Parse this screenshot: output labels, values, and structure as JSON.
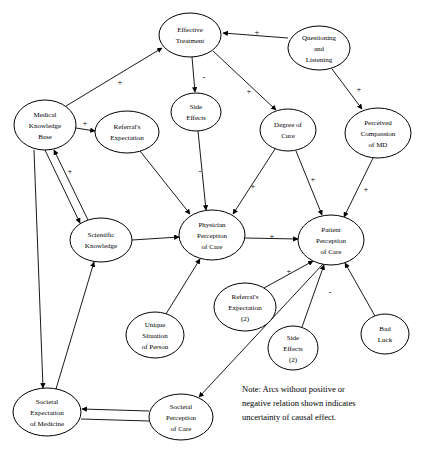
{
  "diagram": {
    "nodes": [
      {
        "id": "effective-treatment",
        "label_lines": [
          "Effective",
          "Treatment"
        ],
        "cx": 190,
        "cy": 35,
        "rx": 31,
        "ry": 22
      },
      {
        "id": "questioning-and-listening",
        "label_lines": [
          "Questioning",
          "and",
          "Listening"
        ],
        "cx": 319,
        "cy": 48,
        "rx": 31,
        "ry": 22
      },
      {
        "id": "medical-knowledge-base",
        "label_lines": [
          "Medical",
          "Knowledge",
          "Base"
        ],
        "cx": 45,
        "cy": 125,
        "rx": 31,
        "ry": 25
      },
      {
        "id": "side-effects",
        "label_lines": [
          "Side",
          "Effects"
        ],
        "cx": 196,
        "cy": 112,
        "rx": 25,
        "ry": 19
      },
      {
        "id": "degree-of-cure",
        "label_lines": [
          "Degree of",
          "Cure"
        ],
        "cx": 288,
        "cy": 130,
        "rx": 28,
        "ry": 21
      },
      {
        "id": "perceived-compassion-of-md",
        "label_lines": [
          "Perceived",
          "Compassion",
          "of MD"
        ],
        "cx": 378,
        "cy": 133,
        "rx": 33,
        "ry": 25
      },
      {
        "id": "referrals-expectation",
        "label_lines": [
          "Referral's",
          "Expectation"
        ],
        "cx": 127,
        "cy": 132,
        "rx": 32,
        "ry": 21
      },
      {
        "id": "scientific-knowledge",
        "label_lines": [
          "Scientific",
          "Knowledge"
        ],
        "cx": 101,
        "cy": 240,
        "rx": 31,
        "ry": 22
      },
      {
        "id": "physician-perception-of-care",
        "label_lines": [
          "Physician",
          "Perception",
          "of Care"
        ],
        "cx": 212,
        "cy": 235,
        "rx": 33,
        "ry": 25
      },
      {
        "id": "patient-perception-of-care",
        "label_lines": [
          "Patient",
          "Perception",
          "of Care"
        ],
        "cx": 331,
        "cy": 240,
        "rx": 33,
        "ry": 25
      },
      {
        "id": "referrals-expectation-2",
        "label_lines": [
          "Referral's",
          "Expectation",
          "(2)"
        ],
        "cx": 245,
        "cy": 307,
        "rx": 31,
        "ry": 24
      },
      {
        "id": "unique-situation-of-person",
        "label_lines": [
          "Unique",
          "Situation",
          "of Person"
        ],
        "cx": 155,
        "cy": 335,
        "rx": 29,
        "ry": 23
      },
      {
        "id": "side-effects-2",
        "label_lines": [
          "Side",
          "Effects",
          "(2)"
        ],
        "cx": 293,
        "cy": 348,
        "rx": 25,
        "ry": 22
      },
      {
        "id": "bad-luck",
        "label_lines": [
          "Bad",
          "Luck"
        ],
        "cx": 385,
        "cy": 334,
        "rx": 24,
        "ry": 20
      },
      {
        "id": "societal-expectation-of-medicine",
        "label_lines": [
          "Societal",
          "Expectation",
          "of Medicine"
        ],
        "cx": 47,
        "cy": 412,
        "rx": 34,
        "ry": 24
      },
      {
        "id": "societal-perception-of-care",
        "label_lines": [
          "Societal",
          "Perception",
          "of Care"
        ],
        "cx": 181,
        "cy": 417,
        "rx": 32,
        "ry": 23
      }
    ],
    "edge_signs": [
      {
        "id": "sign-effective-treatment-from-questioning",
        "text": "+",
        "x": 257,
        "y": 33
      },
      {
        "id": "sign-medical-knowledge-to-effective-treatment",
        "text": "+",
        "x": 120,
        "y": 83
      },
      {
        "id": "sign-effective-treatment-to-side-effects",
        "text": "-",
        "x": 204,
        "y": 78
      },
      {
        "id": "sign-effective-treatment-to-degree-of-cure",
        "text": "+",
        "x": 249,
        "y": 92
      },
      {
        "id": "sign-questioning-to-perceived-compassion",
        "text": "+",
        "x": 359,
        "y": 90
      },
      {
        "id": "sign-medical-knowledge-to-referrals",
        "text": "+",
        "x": 85,
        "y": 124
      },
      {
        "id": "sign-side-effects-to-physician-perception",
        "text": "-",
        "x": 200,
        "y": 172
      },
      {
        "id": "sign-degree-of-cure-to-physician-perception",
        "text": "+",
        "x": 253,
        "y": 187
      },
      {
        "id": "sign-degree-of-cure-to-patient-perception",
        "text": "+",
        "x": 313,
        "y": 180
      },
      {
        "id": "sign-scientific-to-medical-knowledge",
        "text": "+",
        "x": 70,
        "y": 172
      },
      {
        "id": "sign-perceived-compassion-to-patient-perception",
        "text": "+",
        "x": 366,
        "y": 190
      },
      {
        "id": "sign-physician-to-patient-perception",
        "text": "+",
        "x": 272,
        "y": 237
      },
      {
        "id": "sign-referrals2-to-patient-perception",
        "text": "+",
        "x": 289,
        "y": 272
      },
      {
        "id": "sign-side-effects2-to-patient-perception",
        "text": "-",
        "x": 330,
        "y": 293
      }
    ],
    "note": {
      "lines": [
        "Note: Arcs without positive or",
        "negative relation shown indicates",
        "uncertainty of causal effect."
      ],
      "x": 242,
      "y": 392
    }
  }
}
